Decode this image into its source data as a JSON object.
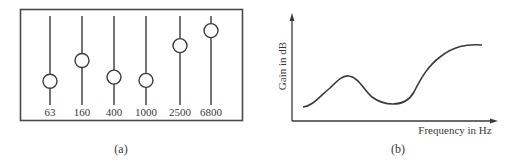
{
  "panel_a": {
    "caption": "(a)",
    "description": "Graphic equalizer slider panel",
    "sliders": [
      {
        "label": "63",
        "position": 0.25
      },
      {
        "label": "160",
        "position": 0.5
      },
      {
        "label": "400",
        "position": 0.3
      },
      {
        "label": "1000",
        "position": 0.26
      },
      {
        "label": "2500",
        "position": 0.68
      },
      {
        "label": "6800",
        "position": 0.86
      }
    ]
  },
  "panel_b": {
    "caption": "(b)",
    "ylabel": "Gain in dB",
    "xlabel": "Frequency in Hz"
  },
  "chart_data": [
    {
      "type": "diagram",
      "title": "Graphic equalizer sliders",
      "categories": [
        "63",
        "160",
        "400",
        "1000",
        "2500",
        "6800"
      ],
      "values": [
        0.25,
        0.5,
        0.3,
        0.26,
        0.68,
        0.86
      ],
      "value_description": "relative slider position (0 = bottom, 1 = top)"
    },
    {
      "type": "line",
      "title": "",
      "xlabel": "Frequency in Hz",
      "ylabel": "Gain in dB",
      "grid": false,
      "axis_ticks": false,
      "x": [
        0.0,
        0.13,
        0.25,
        0.36,
        0.5,
        0.6,
        0.72,
        0.85,
        1.0
      ],
      "values": [
        0.15,
        0.28,
        0.44,
        0.28,
        0.15,
        0.24,
        0.58,
        0.74,
        0.78
      ],
      "value_description": "qualitative response curve, normalized coordinates"
    }
  ]
}
